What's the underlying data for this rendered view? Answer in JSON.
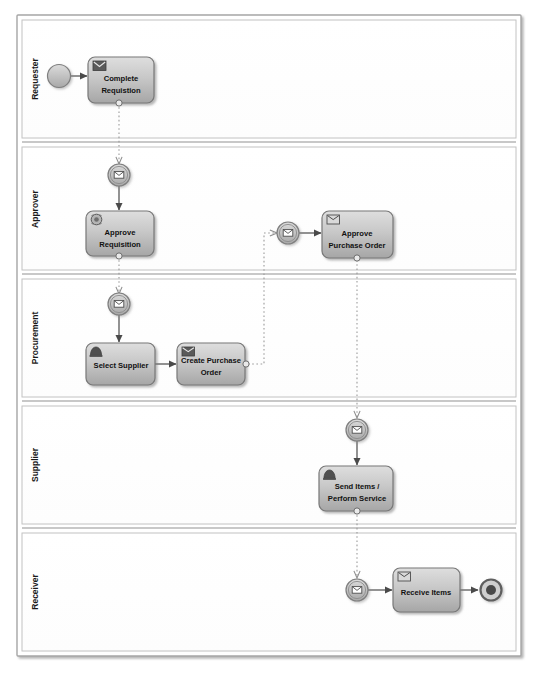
{
  "diagram": {
    "type": "bpmn-collaboration",
    "colors": {
      "pool_border": "#9a9a9a",
      "lane_border": "#b0b0b0",
      "task_fill_top": "#d8d8d8",
      "task_fill_bottom": "#a9a9a9",
      "task_border": "#7b7b7b",
      "task_text": "#111111",
      "event_fill": "#c9c9c9",
      "event_border": "#808080",
      "sequence_flow": "#555555",
      "message_flow": "#9b9b9b",
      "canvas": "#ffffff"
    }
  },
  "pool": {
    "name": "",
    "lanes": [
      {
        "id": "requester",
        "label": "Requester"
      },
      {
        "id": "approver",
        "label": "Approver"
      },
      {
        "id": "procurement",
        "label": "Procurement"
      },
      {
        "id": "supplier",
        "label": "Supplier"
      },
      {
        "id": "receiver",
        "label": "Receiver"
      }
    ]
  },
  "tasks": [
    {
      "id": "complete-requisition",
      "lane": "Requester",
      "label_lines": [
        "Complete",
        "Requistion"
      ],
      "marker_icon": "envelope-icon",
      "boundary_event": "message-boundary-event"
    },
    {
      "id": "approve-requisition",
      "lane": "Approver",
      "label_lines": [
        "Approve",
        "Requisition"
      ],
      "marker_icon": "user-task-icon",
      "boundary_event": "message-boundary-event"
    },
    {
      "id": "approve-purchase-order",
      "lane": "Approver",
      "label_lines": [
        "Approve",
        "Purchase Order"
      ],
      "marker_icon": "envelope-icon",
      "boundary_event": "message-boundary-event"
    },
    {
      "id": "select-supplier",
      "lane": "Procurement",
      "label_lines": [
        "Select Supplier"
      ],
      "marker_icon": "manual-task-icon",
      "boundary_event": null
    },
    {
      "id": "create-purchase-order",
      "lane": "Procurement",
      "label_lines": [
        "Create Purchase",
        "Order"
      ],
      "marker_icon": "envelope-icon",
      "boundary_event": "message-boundary-event-right"
    },
    {
      "id": "send-items-perform-service",
      "lane": "Supplier",
      "label_lines": [
        "Send Items /",
        "Perform Service"
      ],
      "marker_icon": "manual-task-icon",
      "boundary_event": "message-boundary-event"
    },
    {
      "id": "receive-items",
      "lane": "Receiver",
      "label_lines": [
        "Receive Items"
      ],
      "marker_icon": "envelope-icon",
      "boundary_event": null
    }
  ],
  "events": [
    {
      "id": "start-event",
      "lane": "Requester",
      "kind": "start-event",
      "icon": "none"
    },
    {
      "id": "msg-catch-approve-requisition",
      "lane": "Approver",
      "kind": "intermediate-message-catch",
      "icon": "envelope-icon"
    },
    {
      "id": "msg-catch-approve-po",
      "lane": "Approver",
      "kind": "intermediate-message-catch",
      "icon": "envelope-icon"
    },
    {
      "id": "msg-catch-select-supplier",
      "lane": "Procurement",
      "kind": "intermediate-message-catch",
      "icon": "envelope-icon"
    },
    {
      "id": "msg-catch-send-items",
      "lane": "Supplier",
      "kind": "intermediate-message-catch",
      "icon": "envelope-icon"
    },
    {
      "id": "msg-catch-receive-items",
      "lane": "Receiver",
      "kind": "intermediate-message-catch",
      "icon": "envelope-icon"
    },
    {
      "id": "end-event",
      "lane": "Receiver",
      "kind": "end-event",
      "icon": "none"
    }
  ],
  "flows": [
    {
      "id": "f1",
      "type": "sequence",
      "from": "start-event",
      "to": "complete-requisition"
    },
    {
      "id": "f2",
      "type": "message",
      "from": "complete-requisition",
      "to": "msg-catch-approve-requisition"
    },
    {
      "id": "f3",
      "type": "sequence",
      "from": "msg-catch-approve-requisition",
      "to": "approve-requisition"
    },
    {
      "id": "f4",
      "type": "message",
      "from": "approve-requisition",
      "to": "msg-catch-select-supplier"
    },
    {
      "id": "f5",
      "type": "sequence",
      "from": "msg-catch-select-supplier",
      "to": "select-supplier"
    },
    {
      "id": "f6",
      "type": "sequence",
      "from": "select-supplier",
      "to": "create-purchase-order"
    },
    {
      "id": "f7",
      "type": "message",
      "from": "create-purchase-order",
      "to": "msg-catch-approve-po"
    },
    {
      "id": "f8",
      "type": "sequence",
      "from": "msg-catch-approve-po",
      "to": "approve-purchase-order"
    },
    {
      "id": "f9",
      "type": "message",
      "from": "approve-purchase-order",
      "to": "msg-catch-send-items"
    },
    {
      "id": "f10",
      "type": "sequence",
      "from": "msg-catch-send-items",
      "to": "send-items-perform-service"
    },
    {
      "id": "f11",
      "type": "message",
      "from": "send-items-perform-service",
      "to": "msg-catch-receive-items"
    },
    {
      "id": "f12",
      "type": "sequence",
      "from": "msg-catch-receive-items",
      "to": "receive-items"
    },
    {
      "id": "f13",
      "type": "sequence",
      "from": "receive-items",
      "to": "end-event"
    }
  ]
}
